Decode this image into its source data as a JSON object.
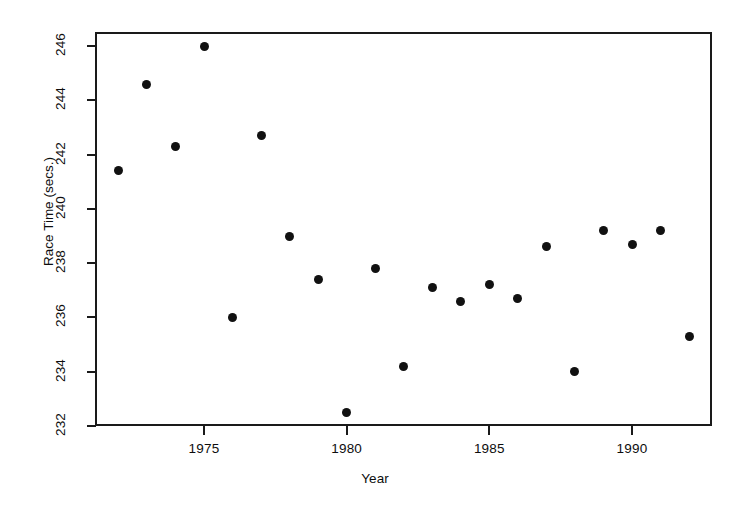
{
  "chart_data": {
    "type": "scatter",
    "title": "",
    "xlabel": "Year",
    "ylabel": "Race Time (secs.)",
    "xlim": [
      1971.2,
      1992.9
    ],
    "ylim": [
      231.4,
      246.6
    ],
    "grid": false,
    "legend": null,
    "marker": {
      "shape": "circle",
      "filled": true,
      "color": "#111111",
      "size_px": 9
    },
    "x_ticks": [
      1975,
      1980,
      1985,
      1990
    ],
    "x_tick_labels": [
      "1975",
      "1980",
      "1985",
      "1990"
    ],
    "y_ticks": [
      232,
      234,
      236,
      238,
      240,
      242,
      244,
      246
    ],
    "y_tick_labels": [
      "232",
      "234",
      "236",
      "238",
      "240",
      "242",
      "244",
      "246"
    ],
    "x": [
      1972,
      1973,
      1974,
      1975,
      1976,
      1977,
      1978,
      1979,
      1980,
      1981,
      1982,
      1983,
      1984,
      1985,
      1986,
      1987,
      1988,
      1989,
      1990,
      1991,
      1992
    ],
    "y": [
      241.4,
      244.6,
      242.3,
      246.0,
      236.0,
      242.7,
      239.0,
      237.4,
      232.5,
      237.8,
      234.2,
      237.1,
      236.6,
      237.2,
      236.7,
      238.6,
      234.0,
      239.2,
      238.7,
      239.2,
      235.3
    ],
    "points": [
      {
        "year": 1972,
        "time": 241.4
      },
      {
        "year": 1973,
        "time": 244.6
      },
      {
        "year": 1974,
        "time": 242.3
      },
      {
        "year": 1975,
        "time": 246.0
      },
      {
        "year": 1976,
        "time": 236.0
      },
      {
        "year": 1977,
        "time": 242.7
      },
      {
        "year": 1978,
        "time": 239.0
      },
      {
        "year": 1979,
        "time": 237.4
      },
      {
        "year": 1980,
        "time": 232.5
      },
      {
        "year": 1981,
        "time": 237.8
      },
      {
        "year": 1982,
        "time": 234.2
      },
      {
        "year": 1983,
        "time": 237.1
      },
      {
        "year": 1984,
        "time": 236.6
      },
      {
        "year": 1985,
        "time": 237.2
      },
      {
        "year": 1986,
        "time": 236.7
      },
      {
        "year": 1987,
        "time": 238.6
      },
      {
        "year": 1988,
        "time": 234.0
      },
      {
        "year": 1989,
        "time": 239.2
      },
      {
        "year": 1990,
        "time": 238.7
      },
      {
        "year": 1991,
        "time": 239.2
      },
      {
        "year": 1992,
        "time": 235.3
      }
    ]
  },
  "colors": {
    "axis": "#1a1a1a",
    "marker": "#111111",
    "text": "#0d0d0d",
    "background": "#ffffff"
  }
}
